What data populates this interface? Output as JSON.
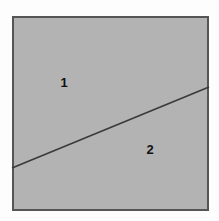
{
  "figure": {
    "background_color": "#fdfdfd",
    "canvas": {
      "width": 219,
      "height": 221
    },
    "square": {
      "name": "outer-square",
      "fill_color": "#b3b3b3",
      "stroke_color": "#555555",
      "stroke_width": 2,
      "x": 12,
      "y": 16,
      "width": 197,
      "height": 195
    },
    "divider_line": {
      "name": "diagonal-divider",
      "stroke_color": "#3a3a3a",
      "stroke_width": 1.6,
      "x1": 12,
      "y1": 168,
      "x2": 209,
      "y2": 87
    },
    "labels": [
      {
        "id": "region-1",
        "text": "1",
        "x": 64,
        "y": 84
      },
      {
        "id": "region-2",
        "text": "2",
        "x": 150,
        "y": 151
      }
    ]
  },
  "chart_data": {
    "type": "diagram",
    "shapes": [
      {
        "kind": "rectangle",
        "label": "square",
        "x": 12,
        "y": 16,
        "width": 197,
        "height": 195,
        "fill": "#b3b3b3",
        "stroke": "#555555"
      },
      {
        "kind": "line",
        "label": "diagonal-divider",
        "x1": 12,
        "y1": 168,
        "x2": 209,
        "y2": 87,
        "stroke": "#3a3a3a"
      }
    ],
    "annotations": [
      {
        "text": "1",
        "x": 64,
        "y": 84,
        "region": "upper-left"
      },
      {
        "text": "2",
        "x": 150,
        "y": 151,
        "region": "lower-right"
      }
    ],
    "grid": false,
    "legend": null,
    "xlabel": "",
    "ylabel": ""
  }
}
